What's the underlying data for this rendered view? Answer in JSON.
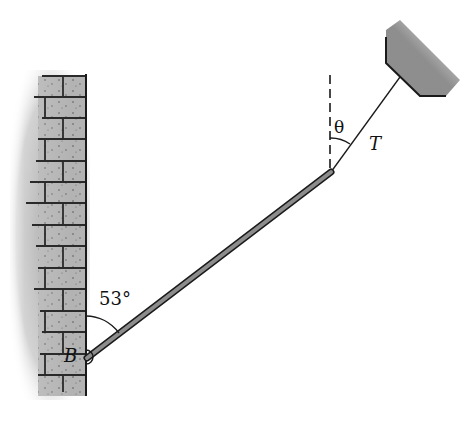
{
  "diagram": {
    "type": "physics-statics",
    "labels": {
      "angle_wall": "53°",
      "hinge": "B",
      "rope_angle": "θ",
      "tension": "T"
    },
    "colors": {
      "ink": "#1a1a1a",
      "rod_fill": "#8c8c8c",
      "brick_fill": "#a9a9a9",
      "mortar": "#2a2a2a"
    },
    "geometry": {
      "wall_right_x": 86,
      "wall_top_y": 75,
      "wall_bottom_y": 396,
      "rod_start": [
        86,
        358
      ],
      "rod_end": [
        331,
        172
      ],
      "rope_start": [
        331,
        172
      ],
      "rope_end": [
        400,
        77
      ],
      "dashed_vertical_top_y": 75
    }
  }
}
